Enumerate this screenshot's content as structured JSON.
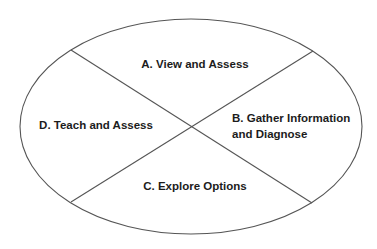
{
  "diagram": {
    "type": "quadrant-ellipse",
    "colors": {
      "background": "#ffffff",
      "stroke": "#555555",
      "text": "#1c1c1c"
    },
    "ellipse": {
      "cx": 191,
      "cy": 126.5,
      "rx": 171,
      "ry": 107.5
    },
    "dividers": [
      {
        "name": "divider-descending",
        "x1": 71,
        "y1": 50,
        "x2": 312,
        "y2": 203
      },
      {
        "name": "divider-ascending",
        "x1": 313,
        "y1": 51,
        "x2": 71,
        "y2": 202
      }
    ],
    "quadrants": [
      {
        "id": "A",
        "position": "top",
        "lines": [
          "A. View and Assess"
        ]
      },
      {
        "id": "B",
        "position": "right",
        "lines": [
          "B. Gather Information",
          "and Diagnose"
        ]
      },
      {
        "id": "C",
        "position": "bottom",
        "lines": [
          "C. Explore Options"
        ]
      },
      {
        "id": "D",
        "position": "left",
        "lines": [
          "D. Teach and Assess"
        ]
      }
    ]
  }
}
